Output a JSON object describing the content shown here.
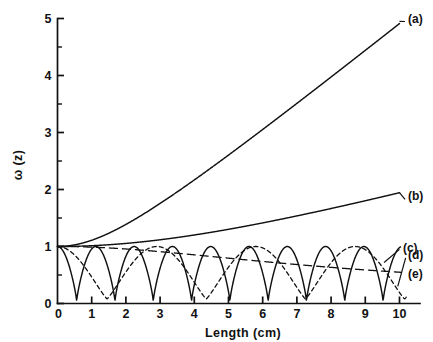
{
  "chart_data": {
    "type": "line",
    "title": "",
    "xlabel": "Length (cm)",
    "ylabel": "ω (z)",
    "xlim": [
      0,
      10.6
    ],
    "ylim": [
      0,
      5
    ],
    "xticks": [
      0,
      1,
      2,
      3,
      4,
      5,
      6,
      7,
      8,
      9,
      10
    ],
    "xtick_labels": [
      "0",
      "1",
      "2",
      "3",
      "4",
      "5",
      "6",
      "7",
      "8",
      "9",
      "10"
    ],
    "yticks": [
      0,
      1,
      2,
      3,
      4,
      5
    ],
    "ytick_labels": [
      "0",
      "1",
      "2",
      "3",
      "4",
      "5"
    ],
    "yminor_ticks": [
      0.5,
      1.5,
      2.5,
      3.5,
      4.5
    ],
    "grid": false,
    "legend_position": "inline-right-labels",
    "axis_color": "#111111",
    "curve_color": "#111111",
    "series": [
      {
        "name": "(a)",
        "label": "(a)",
        "style": "solid",
        "label_x": 10.25,
        "label_y": 5.0,
        "leader": true,
        "model": "hyperbolic",
        "w0": 1.0,
        "zr": 2.08,
        "x": [
          0,
          0.5,
          1,
          1.5,
          2,
          2.5,
          3,
          3.5,
          4,
          4.5,
          5,
          5.5,
          6,
          6.5,
          7,
          7.5,
          8,
          8.5,
          9,
          9.5,
          10
        ],
        "y": [
          1.0,
          1.029,
          1.111,
          1.234,
          1.389,
          1.566,
          1.76,
          1.965,
          2.178,
          2.397,
          2.62,
          2.847,
          3.076,
          3.307,
          3.539,
          3.773,
          4.007,
          4.242,
          4.478,
          4.714,
          4.95
        ]
      },
      {
        "name": "(b)",
        "label": "(b)",
        "style": "solid",
        "label_x": 10.25,
        "label_y": 1.88,
        "leader": true,
        "model": "hyperbolic",
        "w0": 1.0,
        "zr": 6.0,
        "x": [
          0,
          0.5,
          1,
          1.5,
          2,
          2.5,
          3,
          3.5,
          4,
          4.5,
          5,
          5.5,
          6,
          6.5,
          7,
          7.5,
          8,
          8.5,
          9,
          9.5,
          10
        ],
        "y": [
          1.0,
          1.003,
          1.014,
          1.031,
          1.054,
          1.083,
          1.118,
          1.158,
          1.202,
          1.25,
          1.302,
          1.357,
          1.414,
          1.474,
          1.537,
          1.601,
          1.667,
          1.734,
          1.803,
          1.873,
          1.944
        ]
      },
      {
        "name": "(c)",
        "label": "(c)",
        "style": "long-dash",
        "label_x": 10.1,
        "label_y": 0.98,
        "leader": false,
        "model": "slow-decay",
        "x": [
          0,
          1,
          2,
          3,
          4,
          5,
          6,
          7,
          8,
          9,
          10
        ],
        "y": [
          1.0,
          0.975,
          0.945,
          0.91,
          0.872,
          0.833,
          0.793,
          0.753,
          0.714,
          0.676,
          0.64
        ]
      },
      {
        "name": "(d)",
        "label": "(d)",
        "style": "short-dash",
        "label_x": 10.25,
        "label_y": 0.85,
        "leader": false,
        "model": "slow-oscillation",
        "period": 2.9,
        "min_value": 0.08,
        "max_value": 1.0,
        "x": [
          0,
          0.36,
          0.73,
          1.09,
          1.45,
          1.81,
          2.18,
          2.54,
          2.9,
          3.26,
          3.63,
          3.99,
          4.35,
          4.71,
          5.08,
          5.44,
          5.8,
          6.16,
          6.53,
          6.89,
          7.25,
          7.61,
          7.98,
          8.34,
          8.7,
          9.06,
          9.43,
          9.79,
          10
        ],
        "y": [
          1.0,
          0.79,
          0.4,
          0.14,
          0.08,
          0.22,
          0.55,
          0.86,
          1.0,
          0.88,
          0.56,
          0.24,
          0.08,
          0.16,
          0.43,
          0.8,
          1.0,
          0.9,
          0.6,
          0.28,
          0.09,
          0.13,
          0.38,
          0.74,
          0.99,
          0.93,
          0.65,
          0.32,
          0.2
        ]
      },
      {
        "name": "(e)",
        "label": "(e)",
        "style": "solid",
        "label_x": 10.25,
        "label_y": 0.52,
        "leader": false,
        "model": "fast-oscillation",
        "period": 1.12,
        "min_value": 0.04,
        "max_value": 1.0,
        "x": [
          0,
          0.56,
          1.12,
          1.68,
          2.24,
          2.8,
          3.36,
          3.92,
          4.48,
          5.04,
          5.6,
          6.16,
          6.72,
          7.28,
          7.84,
          8.4,
          8.96,
          9.52,
          10
        ],
        "y": [
          1.0,
          0.04,
          1.0,
          0.04,
          1.0,
          0.04,
          1.0,
          0.04,
          1.0,
          0.04,
          1.0,
          0.04,
          1.0,
          0.04,
          1.0,
          0.04,
          1.0,
          0.04,
          0.72
        ]
      }
    ]
  }
}
